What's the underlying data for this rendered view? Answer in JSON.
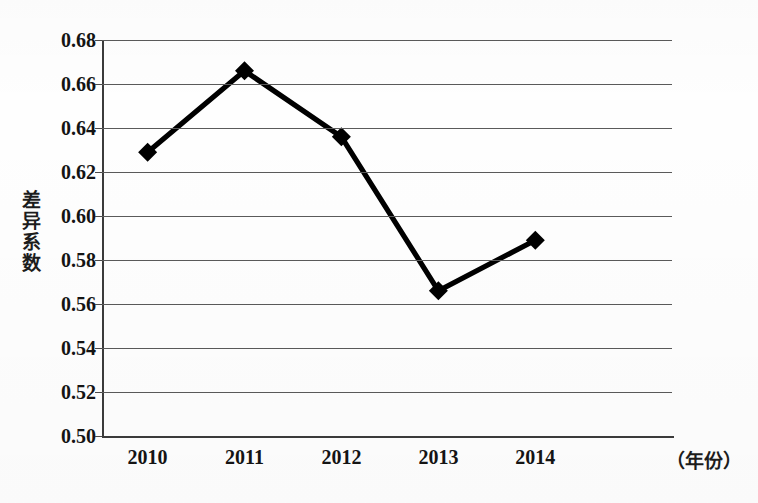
{
  "chart_data": {
    "type": "line",
    "title": "",
    "xlabel": "（年份）",
    "ylabel": "差异系数",
    "categories": [
      "2010",
      "2011",
      "2012",
      "2013",
      "2014"
    ],
    "values": [
      0.629,
      0.666,
      0.636,
      0.566,
      0.589
    ],
    "series": [
      {
        "name": "差异系数",
        "values": [
          0.629,
          0.666,
          0.636,
          0.566,
          0.589
        ]
      }
    ],
    "ylim": [
      0.5,
      0.68
    ],
    "ytick_step": 0.02,
    "ytick_labels": [
      "0.68",
      "0.66",
      "0.64",
      "0.62",
      "0.60",
      "0.58",
      "0.56",
      "0.54",
      "0.52",
      "0.50"
    ],
    "ytick_values": [
      0.68,
      0.66,
      0.64,
      0.62,
      0.6,
      0.58,
      0.56,
      0.54,
      0.52,
      0.5
    ],
    "grid": true,
    "legend": false,
    "legend_position": "none",
    "marker": "diamond",
    "line_color": "#000000",
    "marker_color": "#000000",
    "grid_color": "#5a5a5a",
    "axis_color": "#3b3b3b"
  },
  "axes": {
    "y_title": "差异系数",
    "x_unit_label": "（年份）"
  }
}
